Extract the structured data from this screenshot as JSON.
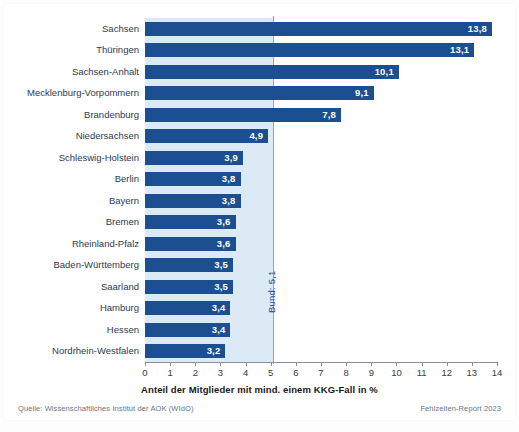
{
  "chart_data": {
    "type": "bar",
    "orientation": "horizontal",
    "title": "",
    "xlabel": "Anteil der Mitglieder mit mind. einem KKG-Fall in %",
    "ylabel": "",
    "xlim": [
      0,
      14
    ],
    "xticks": [
      "0",
      "1",
      "2",
      "3",
      "4",
      "5",
      "6",
      "7",
      "8",
      "9",
      "10",
      "11",
      "12",
      "13",
      "14"
    ],
    "grid": false,
    "legend": null,
    "categories": [
      "Sachsen",
      "Thüringen",
      "Sachsen-Anhalt",
      "Mecklenburg-Vorpommern",
      "Brandenburg",
      "Niedersachsen",
      "Schleswig-Holstein",
      "Berlin",
      "Bayern",
      "Bremen",
      "Rheinland-Pfalz",
      "Baden-Württemberg",
      "Saarland",
      "Hamburg",
      "Hessen",
      "Nordrhein-Westfalen"
    ],
    "values": [
      13.8,
      13.1,
      10.1,
      9.1,
      7.8,
      4.9,
      3.9,
      3.8,
      3.8,
      3.6,
      3.6,
      3.5,
      3.5,
      3.4,
      3.4,
      3.2
    ],
    "value_labels": [
      "13,8",
      "13,1",
      "10,1",
      "9,1",
      "7,8",
      "4,9",
      "3,9",
      "3,8",
      "3,8",
      "3,6",
      "3,6",
      "3,5",
      "3,5",
      "3,4",
      "3,4",
      "3,2"
    ],
    "reference_line": {
      "value": 5.1,
      "label": "Bund: 5,1"
    },
    "colors": {
      "bar": "#1b4f91",
      "band": "#dbeaf4",
      "reference_line": "#8ba7c4",
      "value_text": "#ffffff",
      "category_text": "#2b3b52",
      "axis": "#8a8f98",
      "background": "#ffffff"
    }
  },
  "footer": {
    "source": "Quelle: Wissenschaftliches Institut der AOK (WIdO)",
    "report": "Fehlzeiten-Report 2023"
  }
}
